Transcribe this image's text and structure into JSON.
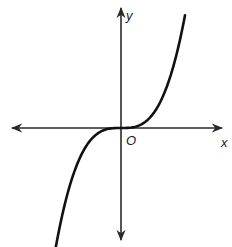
{
  "figure": {
    "title": "",
    "curve_description": "Graph of an odd cubic-like function passing through the origin",
    "axis_labels": {
      "x": "x",
      "y": "y",
      "origin": "O"
    },
    "colors": {
      "axes": "#2a2a2a",
      "curve": "#111111",
      "background": "#ffffff"
    }
  },
  "chart_data": {
    "type": "line",
    "title": "",
    "xlabel": "x",
    "ylabel": "y",
    "origin_label": "O",
    "function": "y = x^3",
    "grid": false,
    "ticks": false,
    "axes_arrows": [
      "left",
      "right",
      "up",
      "down"
    ],
    "series": [
      {
        "name": "curve",
        "x": [
          -1.6,
          -1.4,
          -1.2,
          -1.0,
          -0.8,
          -0.6,
          -0.4,
          -0.2,
          0,
          0.2,
          0.4,
          0.6,
          0.8,
          1.0,
          1.2,
          1.4,
          1.6
        ],
        "y": [
          -4.1,
          -2.74,
          -1.73,
          -1.0,
          -0.51,
          -0.22,
          -0.06,
          -0.01,
          0,
          0.01,
          0.06,
          0.22,
          0.51,
          1.0,
          1.73,
          2.74,
          4.1
        ]
      }
    ]
  }
}
